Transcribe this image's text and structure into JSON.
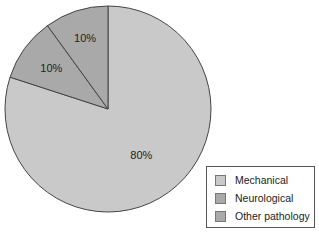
{
  "chart_data": {
    "type": "pie",
    "title": "",
    "categories": [
      "Mechanical",
      "Neurological",
      "Other pathology"
    ],
    "values": [
      80,
      10,
      10
    ],
    "value_labels": [
      "80%",
      "10%",
      "10%"
    ],
    "colors": [
      "#c9c9c9",
      "#a9a9a9",
      "#a9a9a9"
    ],
    "start_angle_deg": 0,
    "direction": "clockwise from 12 o'clock",
    "legend_position": "bottom-right"
  },
  "legend": {
    "items": [
      {
        "label": "Mechanical",
        "color": "#c9c9c9"
      },
      {
        "label": "Neurological",
        "color": "#a9a9a9"
      },
      {
        "label": "Other pathology",
        "color": "#a9a9a9"
      }
    ]
  }
}
